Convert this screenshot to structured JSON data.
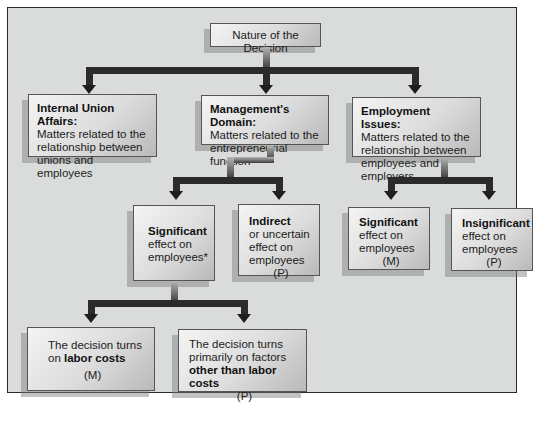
{
  "root": {
    "label": "Nature of the Decision"
  },
  "level1": [
    {
      "title": "Internal Union Affairs:",
      "body": "Matters related to the relationship between unions and employees"
    },
    {
      "title": "Management's Domain:",
      "body": "Matters related to the entrepreneurial function"
    },
    {
      "title": "Employment Issues:",
      "body": "Matters related to the relationship between employees and employers"
    }
  ],
  "management_children": [
    {
      "title": "Significant",
      "body": "effect on employees*",
      "tag": ""
    },
    {
      "title": "Indirect",
      "body": "or uncertain effect on employees",
      "tag": "(P)"
    }
  ],
  "employment_children": [
    {
      "title": "Significant",
      "body": "effect on employees",
      "tag": "(M)"
    },
    {
      "title": "Insignificant",
      "body": "effect on employees",
      "tag": "(P)"
    }
  ],
  "significant_children": [
    {
      "pre": "The decision turns on",
      "bold": "labor costs",
      "tag": "(M)"
    },
    {
      "pre": "The decision turns primarily on factors",
      "bold": "other than labor costs",
      "tag": "(P)"
    }
  ],
  "colors": {
    "frame_bg": "#dadcdc",
    "connector": "#2b2b2b",
    "border": "#2a2a2a"
  }
}
